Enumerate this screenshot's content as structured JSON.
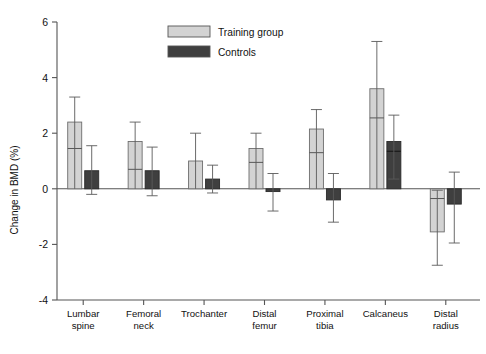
{
  "chart_data": {
    "type": "bar",
    "title": "",
    "xlabel": "",
    "ylabel": "Change in BMD (%)",
    "ylim": [
      -4,
      6
    ],
    "yticks": [
      -4,
      -2,
      0,
      2,
      4,
      6
    ],
    "ytick_labels": [
      "-4",
      "-2",
      "0",
      "2",
      "4",
      "6"
    ],
    "grid": false,
    "legend_position": "top-center",
    "categories": [
      "Lumbar spine",
      "Femoral neck",
      "Trochanter",
      "Distal femur",
      "Proximal tibia",
      "Calcaneus",
      "Distal radius"
    ],
    "category_lines": [
      [
        "Lumbar",
        "spine"
      ],
      [
        "Femoral",
        "neck"
      ],
      [
        "Trochanter",
        ""
      ],
      [
        "Distal",
        "femur"
      ],
      [
        "Proximal",
        "tibia"
      ],
      [
        "Calcaneus",
        ""
      ],
      [
        "Distal",
        "radius"
      ]
    ],
    "series": [
      {
        "name": "Training group",
        "color": "#d3d3d3",
        "values": [
          2.4,
          1.7,
          1.0,
          1.45,
          2.15,
          3.6,
          -1.55
        ],
        "inner_marks": [
          1.45,
          0.7,
          null,
          0.95,
          1.3,
          2.55,
          -0.35
        ],
        "err_high": [
          3.3,
          2.4,
          2.0,
          2.0,
          2.85,
          5.3,
          -0.05
        ],
        "err_low": [
          0.0,
          0.0,
          0.0,
          0.0,
          0.0,
          0.0,
          -2.75
        ]
      },
      {
        "name": "Controls",
        "color": "#3f3f3f",
        "values": [
          0.65,
          0.65,
          0.35,
          -0.1,
          -0.4,
          1.7,
          -0.55
        ],
        "inner_marks": [
          null,
          null,
          null,
          null,
          null,
          1.35,
          null
        ],
        "err_high": [
          1.55,
          1.5,
          0.85,
          0.55,
          0.55,
          2.65,
          0.6
        ],
        "err_low": [
          -0.2,
          -0.25,
          -0.15,
          -0.8,
          -1.2,
          0.35,
          -1.95
        ]
      }
    ]
  },
  "legend": {
    "entries": [
      {
        "label": "Training group",
        "swatch": "#d3d3d3"
      },
      {
        "label": "Controls",
        "swatch": "#3f3f3f"
      }
    ]
  }
}
